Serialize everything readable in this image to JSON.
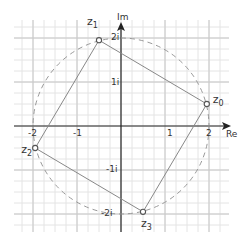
{
  "diagram": {
    "type": "complex-plane",
    "axes": {
      "x_label": "Re",
      "y_label": "Im"
    },
    "x_ticks": [
      {
        "value": -2,
        "label": "-2"
      },
      {
        "value": -1,
        "label": "-1"
      },
      {
        "value": 1,
        "label": "1"
      },
      {
        "value": 2,
        "label": "2"
      }
    ],
    "y_ticks": [
      {
        "value": 2,
        "label": "2i"
      },
      {
        "value": 1,
        "label": "1i"
      },
      {
        "value": -1,
        "label": "-1i"
      },
      {
        "value": -2,
        "label": "-2i"
      }
    ],
    "circle": {
      "radius": 2,
      "style": "dashed"
    },
    "points": [
      {
        "name": "z",
        "sub": "0",
        "re": 1.95,
        "im": 0.5
      },
      {
        "name": "z",
        "sub": "1",
        "re": -0.5,
        "im": 1.95
      },
      {
        "name": "z",
        "sub": "2",
        "re": -1.95,
        "im": -0.5
      },
      {
        "name": "z",
        "sub": "3",
        "re": 0.5,
        "im": -1.95
      }
    ],
    "polygon_order": [
      0,
      1,
      2,
      3
    ],
    "colors": {
      "grid_minor": "#e4e4e4",
      "grid_major": "#c8c8c8",
      "axis": "#222222",
      "polygon": "#888888",
      "circle": "#999999",
      "point": "#555555"
    }
  }
}
